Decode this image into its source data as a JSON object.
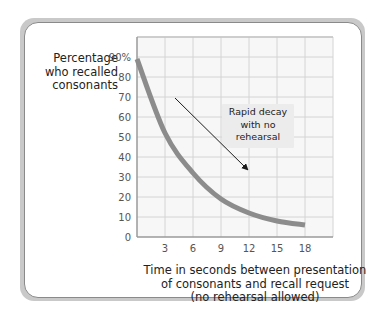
{
  "chart_data": {
    "type": "line",
    "title": "",
    "ylabel": "Percentage who recalled consonants",
    "ylabel_lines": [
      "Percentage",
      "who recalled",
      "consonants"
    ],
    "xlabel": "Time in seconds between presentation of consonants and recall request (no rehearsal allowed)",
    "xlabel_lines": [
      "Time in seconds between presentation",
      "of consonants and recall request",
      "(no rehearsal allowed)"
    ],
    "x": [
      0,
      3,
      6,
      9,
      12,
      15,
      18
    ],
    "series": [
      {
        "name": "Recall",
        "values": [
          89,
          52,
          32,
          19,
          12,
          8,
          6
        ]
      }
    ],
    "xticks": [
      "3",
      "6",
      "9",
      "12",
      "15",
      "18"
    ],
    "yticks": [
      "0",
      "10",
      "20",
      "30",
      "40",
      "50",
      "60",
      "70",
      "80",
      "90%"
    ],
    "xlim": [
      0,
      21
    ],
    "ylim": [
      0,
      100
    ],
    "grid": true,
    "annotation": {
      "text_lines": [
        "Rapid decay",
        "with no",
        "rehearsal"
      ],
      "arrow": true
    },
    "colors": {
      "line": "#8c8c8c",
      "grid": "#d4d4d4",
      "plot_bg": "#f7f7f7",
      "axis": "#9a9a9a",
      "arrow": "#1a1a1a",
      "annotation_bg": "#ececec"
    }
  }
}
